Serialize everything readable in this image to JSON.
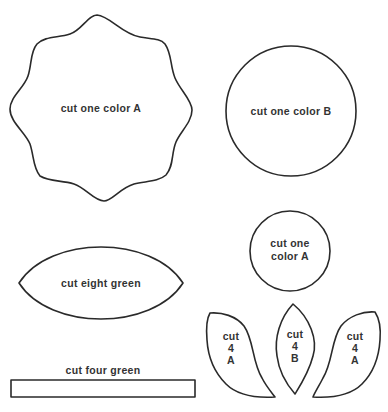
{
  "colors": {
    "outline": "#2a2a2a",
    "text": "#333333",
    "background": "#ffffff"
  },
  "pieces": {
    "scalloped_flower": {
      "shape": "eight-point scalloped flower",
      "label": "cut one color A"
    },
    "large_circle": {
      "shape": "circle",
      "label": "cut one color B"
    },
    "small_circle": {
      "shape": "circle",
      "label_lines": [
        "cut one",
        "color A"
      ]
    },
    "leaf": {
      "shape": "pointed oval leaf",
      "label": "cut eight green"
    },
    "stem": {
      "shape": "rectangle strip",
      "label": "cut four green"
    },
    "petal_left": {
      "shape": "curved petal",
      "label_lines": [
        "cut",
        "4",
        "A"
      ]
    },
    "petal_middle": {
      "shape": "pointed oval petal",
      "label_lines": [
        "cut",
        "4",
        "B"
      ]
    },
    "petal_right": {
      "shape": "curved petal",
      "label_lines": [
        "cut",
        "4",
        "A"
      ]
    }
  }
}
